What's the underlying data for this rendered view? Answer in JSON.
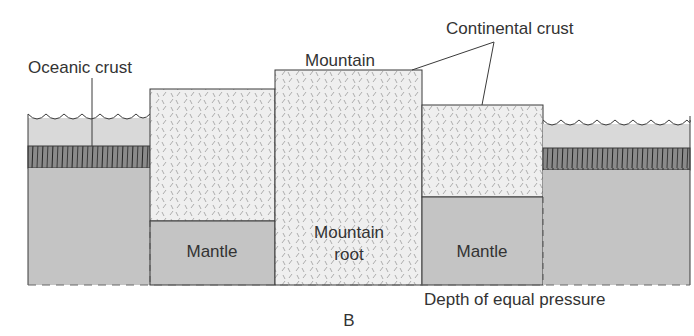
{
  "diagram": {
    "panel_label": "B",
    "labels": {
      "oceanic_crust": "Oceanic crust",
      "mountain": "Mountain",
      "continental_crust": "Continental crust",
      "mantle_left": "Mantle",
      "mountain_root_line1": "Mountain",
      "mountain_root_line2": "root",
      "mantle_right": "Mantle",
      "depth": "Depth of equal pressure"
    },
    "colors": {
      "water": "#d9d9d9",
      "oceanic_crust": "#8a8a8a",
      "mantle": "#c4c4c4",
      "continental_crust": "#efefef",
      "outline": "#3a3a3a",
      "text": "#333333"
    }
  }
}
